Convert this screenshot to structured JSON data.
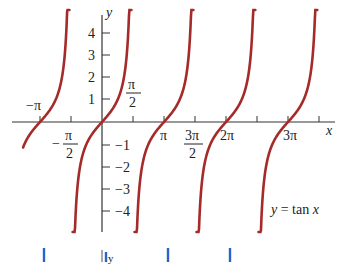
{
  "chart_data": {
    "type": "line",
    "title": "",
    "function_label": "y = tan x",
    "xlabel": "x",
    "ylabel": "y",
    "x_tick_labels": [
      "−π",
      "−π/2",
      "π/2",
      "π",
      "3π/2",
      "2π",
      "3π"
    ],
    "x_ticks": [
      -3.1416,
      -1.5708,
      1.5708,
      3.1416,
      4.7124,
      6.2832,
      7.854,
      9.4248,
      10.9956
    ],
    "y_tick_labels": [
      "4",
      "3",
      "2",
      "1",
      "−1",
      "−2",
      "−3",
      "−4"
    ],
    "y_ticks": [
      4,
      3,
      2,
      1,
      -1,
      -2,
      -3,
      -4
    ],
    "xlim": [
      -4.0,
      12.9
    ],
    "ylim": [
      -5.0,
      5.1
    ],
    "grid": false,
    "series": [
      {
        "name": "tan x branch 1",
        "x_range": [
          -4.0,
          -1.65
        ],
        "color": "#a52a2a"
      },
      {
        "name": "tan x branch 2",
        "x_range": [
          -1.49,
          1.49
        ],
        "color": "#a52a2a"
      },
      {
        "name": "tan x branch 3",
        "x_range": [
          1.65,
          4.63
        ],
        "color": "#a52a2a"
      },
      {
        "name": "tan x branch 4",
        "x_range": [
          4.79,
          7.77
        ],
        "color": "#a52a2a"
      },
      {
        "name": "tan x branch 5",
        "x_range": [
          7.93,
          10.91
        ],
        "color": "#a52a2a"
      }
    ],
    "sample_points": [
      {
        "x": 0,
        "y": 0
      },
      {
        "x": 0.785,
        "y": 1
      },
      {
        "x": 1.107,
        "y": 2
      },
      {
        "x": 1.249,
        "y": 3
      },
      {
        "x": 1.326,
        "y": 4
      },
      {
        "x": -0.785,
        "y": -1
      }
    ],
    "bottom_marks": {
      "color": "#2a64c8",
      "label": "y"
    }
  },
  "labels": {
    "y_axis": "y",
    "x_axis": "x",
    "function": "y = tan x",
    "neg_pi": "−π",
    "pi": "π",
    "two_pi": "2π",
    "three_pi": "3π",
    "pi_over_2_num": "π",
    "pi_over_2_den": "2",
    "neg_pi_over_2_sign": "−",
    "neg_pi_over_2_num": "π",
    "neg_pi_over_2_den": "2",
    "three_pi_over_2_num": "3π",
    "three_pi_over_2_den": "2",
    "y4": "4",
    "y3": "3",
    "y2": "2",
    "y1": "1",
    "ym1": "−1",
    "ym2": "−2",
    "ym3": "−3",
    "ym4": "−4",
    "bottom_y": "y"
  }
}
